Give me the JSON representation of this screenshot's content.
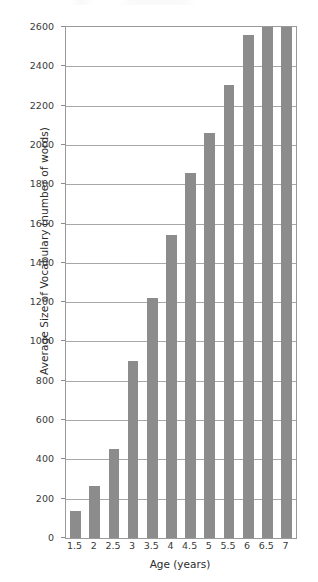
{
  "chart_data": {
    "type": "bar",
    "title": "",
    "xlabel": "Age (years)",
    "ylabel": "Average Size of Vocabulary (number of words)",
    "categories": [
      "1.5",
      "2",
      "2.5",
      "3",
      "3.5",
      "4",
      "4.5",
      "5",
      "5.5",
      "6",
      "6.5",
      "7"
    ],
    "values": [
      140,
      265,
      455,
      900,
      1220,
      1540,
      1855,
      2060,
      2305,
      2560,
      2600,
      2600
    ],
    "ylim": [
      0,
      2600
    ],
    "yticks": [
      0,
      200,
      400,
      600,
      800,
      1000,
      1200,
      1400,
      1600,
      1800,
      2000,
      2200,
      2400,
      2600
    ],
    "ytick_labels": [
      "0",
      "200",
      "400",
      "600",
      "800",
      "1000",
      "1200",
      "1400",
      "1600",
      "1800",
      "2000",
      "2200",
      "2400",
      "2600"
    ],
    "grid": true,
    "legend": false,
    "legend_position": "none",
    "series": [
      {
        "name": "Average Size of Vocabulary",
        "values": [
          140,
          265,
          455,
          900,
          1220,
          1540,
          1855,
          2060,
          2305,
          2560,
          2600,
          2600
        ]
      }
    ],
    "colors": {
      "bar": "#8c8c8c",
      "gridline": "#a8a8a8",
      "axis": "#9a9a9a",
      "text": "#3a3a3a",
      "background": "#ffffff"
    }
  }
}
